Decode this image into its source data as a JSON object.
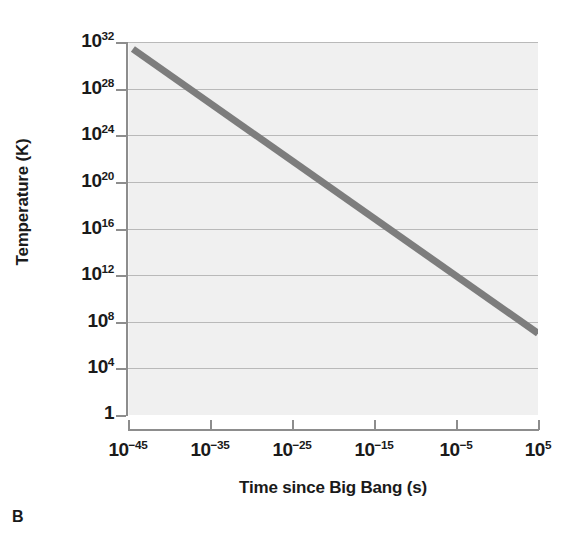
{
  "panel": {
    "letter": "B"
  },
  "chart_data": {
    "type": "line",
    "title": "",
    "xlabel": "Time since Big Bang (s)",
    "ylabel": "Temperature (K)",
    "xscale": "log",
    "yscale": "log",
    "grid": true,
    "legend": null,
    "xlim": [
      1e-45,
      100000.0
    ],
    "ylim": [
      1,
      1e+32
    ],
    "xtick_labels": [
      "10−45",
      "10−35",
      "10−25",
      "10−15",
      "10−5",
      "10⁵"
    ],
    "xtick_mantissa": [
      "10",
      "10",
      "10",
      "10",
      "10",
      "10"
    ],
    "xtick_exponents": [
      "−45",
      "−35",
      "−25",
      "−15",
      "−5",
      "5"
    ],
    "xtick_values": [
      -45,
      -35,
      -25,
      -15,
      -5,
      5
    ],
    "ytick_labels": [
      "10³²",
      "10²⁸",
      "10²⁴",
      "10²⁰",
      "10¹⁶",
      "10¹²",
      "10⁸",
      "10⁴",
      "1"
    ],
    "ytick_mantissa": [
      "10",
      "10",
      "10",
      "10",
      "10",
      "10",
      "10",
      "10",
      "1"
    ],
    "ytick_exponents": [
      "32",
      "28",
      "24",
      "20",
      "16",
      "12",
      "8",
      "4",
      ""
    ],
    "ytick_values": [
      32,
      28,
      24,
      20,
      16,
      12,
      8,
      4,
      0
    ],
    "series": [
      {
        "name": "Temperature of the universe",
        "color": "#7d7d7d",
        "linewidth": 7,
        "x_log10": [
          -44.4,
          5.0
        ],
        "y_log10": [
          31.4,
          7.0
        ],
        "x": [
          4e-45,
          100000.0
        ],
        "y": [
          2.5e+31,
          10000000.0
        ]
      }
    ],
    "annotations": []
  },
  "colors": {
    "plot_background": "#f0f0f0",
    "gridline": "#b9b9b9",
    "axis": "#8d8d8d",
    "line": "#7d7d7d",
    "text": "#1a1a1a"
  }
}
